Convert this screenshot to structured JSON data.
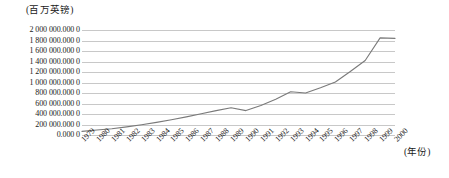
{
  "chart_data": {
    "type": "line",
    "title": "",
    "ylabel": "(百万英镑)",
    "xlabel": "(年份)",
    "ylim": [
      0,
      2000000
    ],
    "grid": true,
    "legend": "none",
    "y_ticks": [
      "2 000 000.000 0",
      "1 800 000.000 0",
      "1 600 000.000 0",
      "1 400 000.000 0",
      "1 200 000.000 0",
      "1 000 000.000 0",
      "800 000.000 0",
      "600 000.000 0",
      "400 000.000 0",
      "200 000.000 0",
      "0.000 0"
    ],
    "y_tick_values": [
      2000000,
      1800000,
      1600000,
      1400000,
      1200000,
      1000000,
      800000,
      600000,
      400000,
      200000,
      0
    ],
    "categories": [
      "1979",
      "1980",
      "1981",
      "1982",
      "1983",
      "1984",
      "1985",
      "1986",
      "1987",
      "1988",
      "1989",
      "1990",
      "1991",
      "1992",
      "1993",
      "1994",
      "1995",
      "1996",
      "1997",
      "1998",
      "1999",
      "2000"
    ],
    "values": [
      70000,
      95000,
      120000,
      155000,
      195000,
      240000,
      290000,
      345000,
      405000,
      465000,
      520000,
      465000,
      560000,
      680000,
      825000,
      800000,
      900000,
      1010000,
      1210000,
      1420000,
      1850000,
      1840000
    ],
    "series_color": "#7a7a7a",
    "grid_color": "#c8c8c8"
  }
}
